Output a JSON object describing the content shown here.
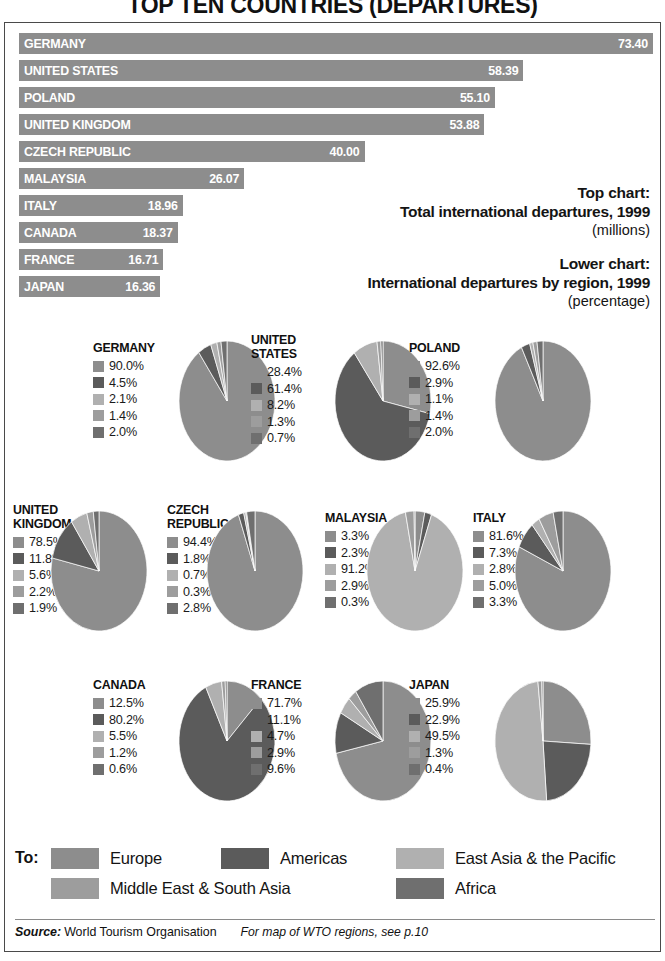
{
  "title": "TOP TEN COUNTRIES (DEPARTURES)",
  "caption": {
    "top_head": "Top chart:",
    "top_main": "Total international departures, 1999",
    "top_unit": "(millions)",
    "lower_head": "Lower chart:",
    "lower_main": "International departures by region, 1999",
    "lower_unit": "(percentage)"
  },
  "colors": {
    "europe": "#8d8d8d",
    "americas": "#5b5b5b",
    "east_asia_pacific": "#b0b0b0",
    "middle_east_south_asia": "#9d9d9d",
    "africa": "#6f6f6f",
    "bar": "#8d8d8d",
    "frame": "#4a4a4a"
  },
  "legend": {
    "to_label": "To:",
    "entries": [
      {
        "label": "Europe",
        "color": "#8d8d8d"
      },
      {
        "label": "Americas",
        "color": "#5b5b5b"
      },
      {
        "label": "East Asia & the Pacific",
        "color": "#b0b0b0"
      },
      {
        "label": "Middle East & South Asia",
        "color": "#9d9d9d"
      },
      {
        "label": "Africa",
        "color": "#6f6f6f"
      }
    ]
  },
  "source": {
    "label": "Source:",
    "value": "World Tourism Organisation",
    "note": "For map of WTO regions, see p.10"
  },
  "chart_data": [
    {
      "type": "bar",
      "title": "Total international departures, 1999",
      "ylabel": "",
      "xlabel": "millions",
      "orientation": "horizontal",
      "xlim": [
        0,
        73.4
      ],
      "grid": false,
      "categories": [
        "GERMANY",
        "UNITED STATES",
        "POLAND",
        "UNITED KINGDOM",
        "CZECH REPUBLIC",
        "MALAYSIA",
        "ITALY",
        "CANADA",
        "FRANCE",
        "JAPAN"
      ],
      "values": [
        73.4,
        58.39,
        55.1,
        53.88,
        40.0,
        26.07,
        18.96,
        18.37,
        16.71,
        16.36
      ],
      "value_labels": [
        "73.40",
        "58.39",
        "55.10",
        "53.88",
        "40.00",
        "26.07",
        "18.96",
        "18.37",
        "16.71",
        "16.36"
      ]
    },
    {
      "type": "pie",
      "title": "International departures by region, 1999 (percentage)",
      "slice_names": [
        "Europe",
        "Americas",
        "East Asia & the Pacific",
        "Middle East & South Asia",
        "Africa"
      ],
      "slice_colors": [
        "#8d8d8d",
        "#5b5b5b",
        "#b0b0b0",
        "#9d9d9d",
        "#6f6f6f"
      ],
      "pies": [
        {
          "name": "GERMANY",
          "values": [
            90.0,
            4.5,
            2.1,
            1.4,
            2.0
          ],
          "labels": [
            "90.0%",
            "4.5%",
            "2.1%",
            "1.4%",
            "2.0%"
          ]
        },
        {
          "name": "UNITED\nSTATES",
          "values": [
            28.4,
            61.4,
            8.2,
            1.3,
            0.7
          ],
          "labels": [
            "28.4%",
            "61.4%",
            "8.2%",
            "1.3%",
            "0.7%"
          ]
        },
        {
          "name": "POLAND",
          "values": [
            92.6,
            2.9,
            1.1,
            1.4,
            2.0
          ],
          "labels": [
            "92.6%",
            "2.9%",
            "1.1%",
            "1.4%",
            "2.0%"
          ]
        },
        {
          "name": "UNITED\nKINGDOM",
          "values": [
            78.5,
            11.8,
            5.6,
            2.2,
            1.9
          ],
          "labels": [
            "78.5%",
            "11.8%",
            "5.6%",
            "2.2%",
            "1.9%"
          ]
        },
        {
          "name": "CZECH\nREPUBLIC",
          "values": [
            94.4,
            1.8,
            0.7,
            0.3,
            2.8
          ],
          "labels": [
            "94.4%",
            "1.8%",
            "0.7%",
            "0.3%",
            "2.8%"
          ]
        },
        {
          "name": "MALAYSIA",
          "values": [
            3.3,
            2.3,
            91.2,
            2.9,
            0.3
          ],
          "labels": [
            "3.3%",
            "2.3%",
            "91.2%",
            "2.9%",
            "0.3%"
          ]
        },
        {
          "name": "ITALY",
          "values": [
            81.6,
            7.3,
            2.8,
            5.0,
            3.3
          ],
          "labels": [
            "81.6%",
            "7.3%",
            "2.8%",
            "5.0%",
            "3.3%"
          ]
        },
        {
          "name": "CANADA",
          "values": [
            12.5,
            80.2,
            5.5,
            1.2,
            0.6
          ],
          "labels": [
            "12.5%",
            "80.2%",
            "5.5%",
            "1.2%",
            "0.6%"
          ]
        },
        {
          "name": "FRANCE",
          "values": [
            71.7,
            11.1,
            4.7,
            2.9,
            9.6
          ],
          "labels": [
            "71.7%",
            "11.1%",
            "4.7%",
            "2.9%",
            "9.6%"
          ]
        },
        {
          "name": "JAPAN",
          "values": [
            25.9,
            22.9,
            49.5,
            1.3,
            0.4
          ],
          "labels": [
            "25.9%",
            "22.9%",
            "49.5%",
            "1.3%",
            "0.4%"
          ]
        }
      ]
    }
  ]
}
